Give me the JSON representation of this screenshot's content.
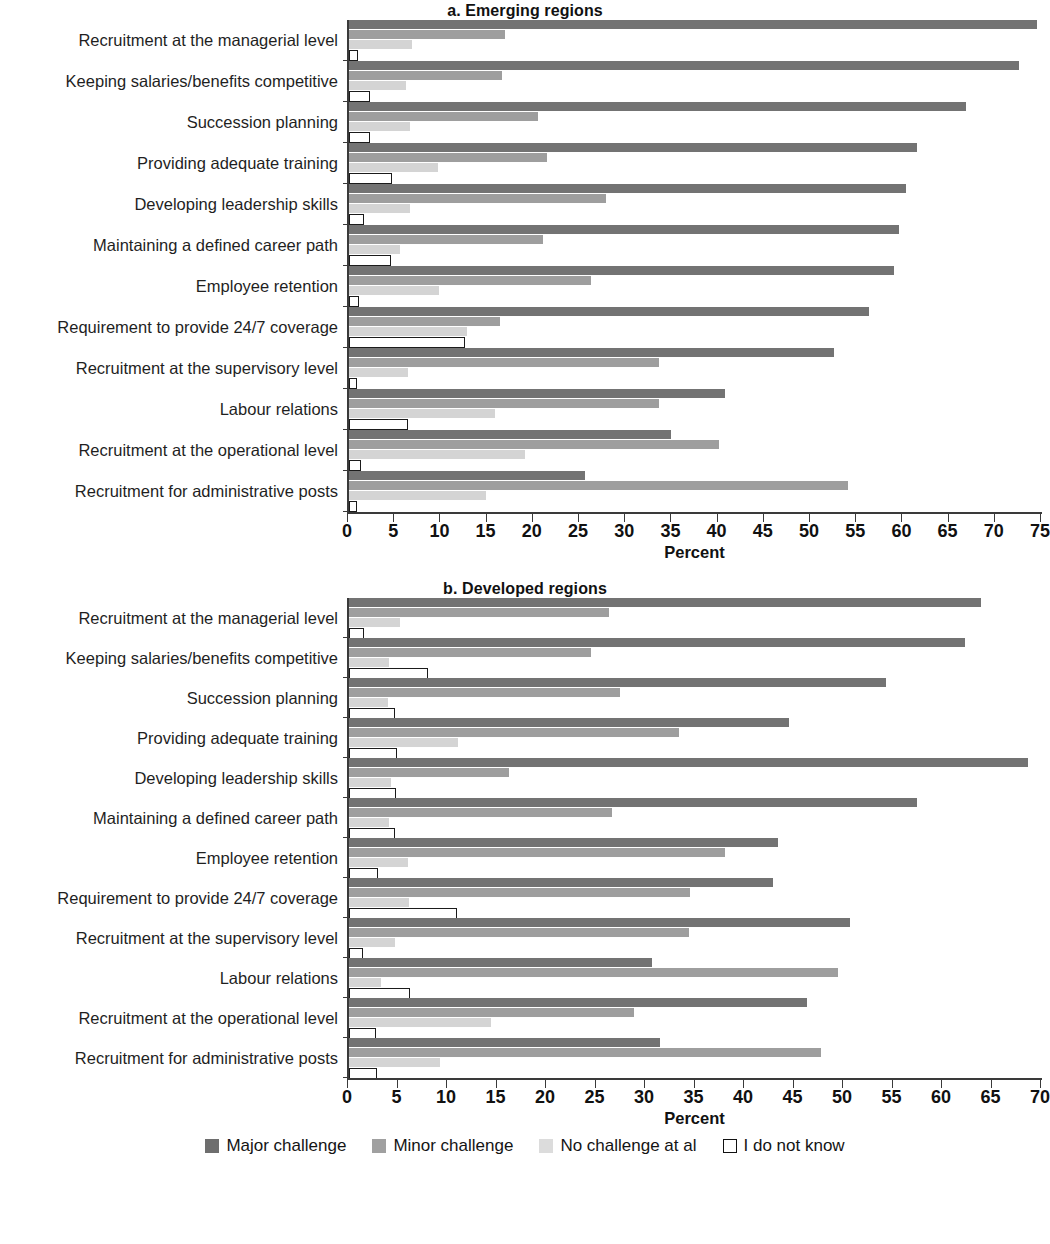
{
  "figure": {
    "legend": [
      {
        "key": "major",
        "label": "Major challenge",
        "color": "#737373"
      },
      {
        "key": "minor",
        "label": "Minor challenge",
        "color": "#9e9e9e"
      },
      {
        "key": "nochal",
        "label": "No challenge at al",
        "color": "#d4d4d4"
      },
      {
        "key": "dunno",
        "label": "I do not know",
        "color": "#ffffff"
      }
    ]
  },
  "chart_data": [
    {
      "type": "bar",
      "orientation": "horizontal",
      "title": "a. Emerging regions",
      "xlabel": "Percent",
      "ylabel": "",
      "xlim": [
        0,
        75
      ],
      "xticks": [
        0,
        5,
        10,
        15,
        20,
        25,
        30,
        35,
        40,
        45,
        50,
        55,
        60,
        65,
        70,
        75
      ],
      "grid": false,
      "legend_position": "bottom",
      "categories": [
        "Recruitment at the managerial level",
        "Keeping salaries/benefits competitive",
        "Succession planning",
        "Providing adequate training",
        "Developing leadership skills",
        "Maintaining a defined career path",
        "Employee retention",
        "Requirement to provide 24/7 coverage",
        "Recruitment at the supervisory level",
        "Labour relations",
        "Recruitment at the operational level",
        "Recruitment for administrative posts"
      ],
      "series": [
        {
          "name": "Major challenge",
          "values": [
            74.5,
            72.5,
            66.8,
            61.5,
            60.3,
            59.5,
            59.0,
            56.3,
            52.5,
            40.7,
            34.8,
            25.5
          ]
        },
        {
          "name": "Minor challenge",
          "values": [
            16.9,
            16.6,
            20.5,
            21.4,
            27.8,
            21.0,
            26.2,
            16.3,
            33.6,
            33.5,
            40.0,
            54.0
          ]
        },
        {
          "name": "No challenge at al",
          "values": [
            6.8,
            6.2,
            6.6,
            9.6,
            6.6,
            5.5,
            9.7,
            12.8,
            6.4,
            15.8,
            19.0,
            14.8
          ]
        },
        {
          "name": "I do not know",
          "values": [
            1.0,
            2.3,
            2.3,
            4.6,
            1.6,
            4.5,
            1.1,
            12.6,
            0.9,
            6.4,
            1.3,
            0.9
          ]
        }
      ]
    },
    {
      "type": "bar",
      "orientation": "horizontal",
      "title": "b. Developed regions",
      "xlabel": "Percent",
      "ylabel": "",
      "xlim": [
        0,
        70
      ],
      "xticks": [
        0,
        5,
        10,
        15,
        20,
        25,
        30,
        35,
        40,
        45,
        50,
        55,
        60,
        65,
        70
      ],
      "grid": false,
      "legend_position": "bottom",
      "categories": [
        "Recruitment at the managerial level",
        "Keeping salaries/benefits competitive",
        "Succession planning",
        "Providing adequate training",
        "Developing leadership skills",
        "Maintaining a defined career path",
        "Employee retention",
        "Requirement to provide 24/7 coverage",
        "Recruitment at the supervisory level",
        "Labour relations",
        "Recruitment at the operational level",
        "Recruitment for administrative posts"
      ],
      "series": [
        {
          "name": "Major challenge",
          "values": [
            63.8,
            62.2,
            54.2,
            44.4,
            68.6,
            57.4,
            43.3,
            42.8,
            50.6,
            30.6,
            46.3,
            31.4
          ]
        },
        {
          "name": "Minor challenge",
          "values": [
            26.3,
            24.4,
            27.4,
            33.3,
            16.2,
            26.6,
            38.0,
            34.4,
            34.3,
            49.4,
            28.8,
            47.7
          ]
        },
        {
          "name": "No challenge at al",
          "values": [
            5.2,
            4.0,
            3.9,
            11.0,
            4.2,
            4.0,
            6.0,
            6.1,
            4.6,
            3.2,
            14.3,
            9.2
          ]
        },
        {
          "name": "I do not know",
          "values": [
            1.5,
            8.0,
            4.6,
            4.8,
            4.7,
            4.6,
            2.9,
            10.9,
            1.4,
            6.2,
            2.7,
            2.8
          ]
        }
      ]
    }
  ]
}
